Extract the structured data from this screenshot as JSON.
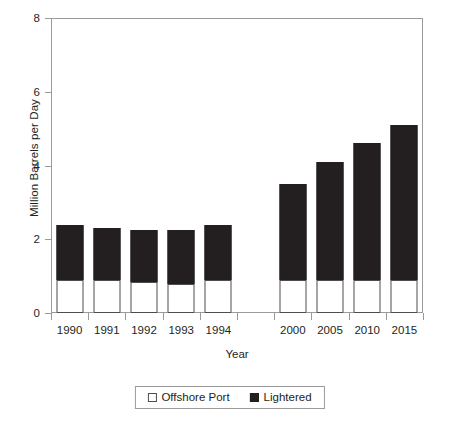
{
  "chart_data": {
    "type": "bar",
    "stacked": true,
    "title": "",
    "xlabel": "Year",
    "ylabel": "Million Barrels per Day",
    "categories": [
      "1990",
      "1991",
      "1992",
      "1993",
      "1994",
      "",
      "2000",
      "2005",
      "2010",
      "2015"
    ],
    "series": [
      {
        "name": "Offshore Port",
        "color": "#ffffff",
        "values": [
          0.9,
          0.9,
          0.85,
          0.8,
          0.9,
          null,
          0.9,
          0.9,
          0.9,
          0.9
        ]
      },
      {
        "name": "Lightered",
        "color": "#231f20",
        "values": [
          1.5,
          1.4,
          1.4,
          1.45,
          1.5,
          null,
          2.6,
          3.2,
          3.7,
          4.2
        ]
      }
    ],
    "totals": [
      2.4,
      2.3,
      2.25,
      2.25,
      2.4,
      null,
      3.5,
      4.1,
      4.6,
      5.1
    ],
    "ylim": [
      0,
      8
    ],
    "yticks": [
      0,
      2,
      4,
      6,
      8
    ],
    "ytick_labels": [
      "0",
      "2",
      "4",
      "6",
      "8"
    ],
    "grid": false,
    "legend_position": "bottom"
  },
  "legend": {
    "items": [
      {
        "label": "Offshore Port",
        "swatch": "open-square-icon"
      },
      {
        "label": "Lightered",
        "swatch": "filled-square-icon"
      }
    ]
  }
}
